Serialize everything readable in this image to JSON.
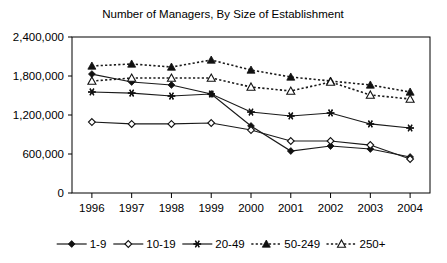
{
  "chart_data": {
    "type": "line",
    "title": "Number of Managers, By Size of Establishment",
    "xlabel": "",
    "ylabel": "",
    "categories": [
      "1996",
      "1997",
      "1998",
      "1999",
      "2000",
      "2001",
      "2002",
      "2003",
      "2004"
    ],
    "ylim": [
      0,
      2400000
    ],
    "yticks": [
      0,
      600000,
      1200000,
      1800000,
      2400000
    ],
    "ytick_labels": [
      "0",
      "600,000",
      "1,200,000",
      "1,800,000",
      "2,400,000"
    ],
    "grid": false,
    "legend_position": "bottom",
    "series": [
      {
        "name": "1-9",
        "marker": "filled-diamond",
        "line_style": "solid",
        "values": [
          1830000,
          1708000,
          1662000,
          1523000,
          1031000,
          646000,
          723000,
          677000,
          554000
        ]
      },
      {
        "name": "10-19",
        "marker": "open-diamond",
        "line_style": "solid",
        "values": [
          1092000,
          1062000,
          1062000,
          1077000,
          969000,
          800000,
          800000,
          738000,
          523000
        ]
      },
      {
        "name": "20-49",
        "marker": "star",
        "line_style": "solid",
        "values": [
          1554000,
          1538000,
          1492000,
          1523000,
          1246000,
          1185000,
          1231000,
          1062000,
          1000000
        ]
      },
      {
        "name": "50-249",
        "marker": "filled-triangle",
        "line_style": "dotted",
        "values": [
          1954000,
          1985000,
          1938000,
          2046000,
          1892000,
          1785000,
          1723000,
          1662000,
          1554000
        ]
      },
      {
        "name": "250+",
        "marker": "open-triangle",
        "line_style": "dotted",
        "values": [
          1723000,
          1769000,
          1769000,
          1769000,
          1631000,
          1569000,
          1708000,
          1508000,
          1446000
        ]
      }
    ]
  }
}
